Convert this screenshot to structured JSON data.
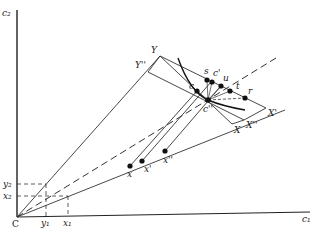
{
  "diagram": {
    "axes": {
      "x_label": "c₁",
      "y_label": "c₂",
      "origin_label": "C",
      "x_ticks": [
        "y₁",
        "x₁"
      ],
      "y_ticks": [
        "y₂",
        "x₂"
      ]
    },
    "vertex_labels": {
      "Y": "Y",
      "Y2": "Y''",
      "X": "X",
      "X1": "X'",
      "X2": "X''"
    },
    "points": {
      "c": "c",
      "s": "s",
      "c1": "c'",
      "u": "u",
      "t": "t",
      "r": "r",
      "c2": "c''",
      "x": "x",
      "x1": "x'",
      "x2": "x''"
    },
    "colors": {
      "line": "#333333",
      "point": "#111111",
      "background": "#ffffff"
    }
  }
}
